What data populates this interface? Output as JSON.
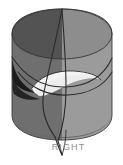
{
  "figure": {
    "title": "RIGHT",
    "caption": "RIGHT",
    "background_color": "#ffffff",
    "canvas": {
      "width": 123,
      "height": 165
    },
    "label_color": "#8e8e8e",
    "parts": {
      "top_ellipse_left": {
        "name": "top-cap-left",
        "color": "#535353"
      },
      "top_ellipse_right": {
        "name": "top-cap-right",
        "color": "#8d8d8d"
      },
      "body_left": {
        "name": "cylinder-body-left",
        "color": "#6f6f6f"
      },
      "body_right": {
        "name": "cylinder-body-right",
        "color": "#9b9b9b"
      },
      "shadow_wedge": {
        "name": "dark-shadow-wedge",
        "color": "#1b1b1b"
      },
      "inner_lens": {
        "name": "intersection-lens-highlight",
        "color": "#f2f2f2"
      },
      "bottom_cap": {
        "name": "bottom-cap",
        "color": "#6a6a6a"
      },
      "curve_stroke": {
        "name": "intersection-curve",
        "color": "#2b2b2b"
      }
    }
  }
}
